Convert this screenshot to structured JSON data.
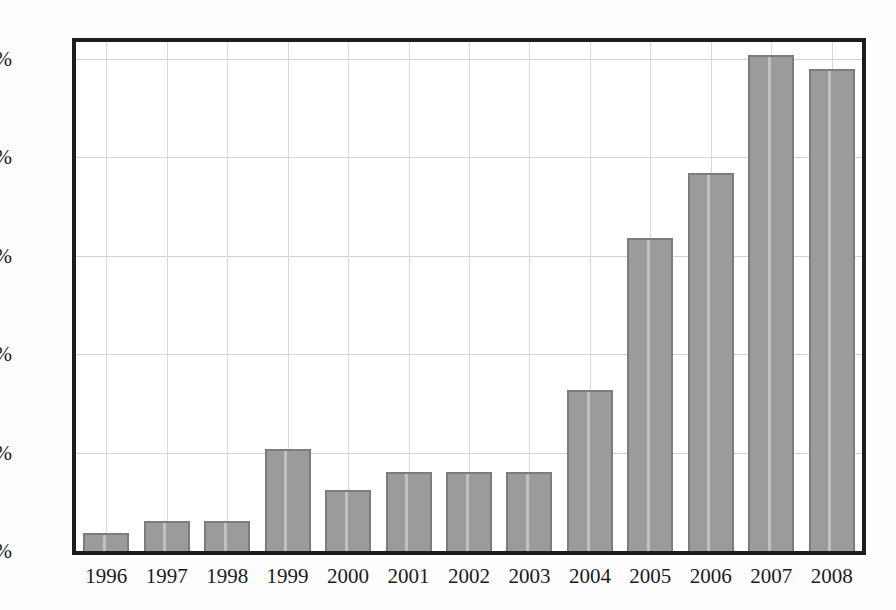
{
  "chart_data": {
    "type": "bar",
    "title": "",
    "subtitle": "",
    "xlabel": "",
    "ylabel": "",
    "categories": [
      "1996",
      "1997",
      "1998",
      "1999",
      "2000",
      "2001",
      "2002",
      "2003",
      "2004",
      "2005",
      "2006",
      "2007",
      "2008"
    ],
    "values": [
      0.9,
      1.5,
      1.5,
      5.2,
      3.1,
      4.0,
      4.0,
      4.0,
      8.2,
      15.9,
      19.2,
      25.2,
      24.5
    ],
    "value_format": "percent",
    "ylim": [
      0,
      25.85
    ],
    "yticks": [
      0,
      5,
      10,
      15,
      20,
      25
    ],
    "ytick_labels": [
      "0%",
      "5%",
      "10%",
      "15%",
      "20%",
      "25%"
    ],
    "grid": {
      "horizontal": true,
      "vertical": true
    },
    "legend": {
      "visible": false,
      "position": "none"
    },
    "annotations": [],
    "colors": {
      "bar_fill": "#9b9b9b",
      "bar_edge": "#7c7c7c",
      "plot_border": "#1d1d1d",
      "gridline": "#d2d2d2",
      "background": "#ffffff",
      "text": "#1b1b1b"
    }
  }
}
